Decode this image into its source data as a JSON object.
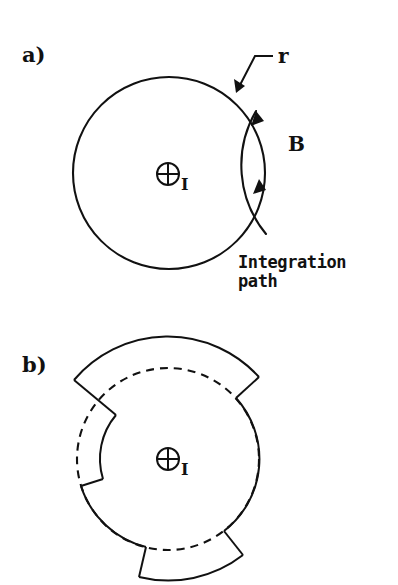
{
  "figure": {
    "domain": "Diagram",
    "background_color": "#ffffff",
    "ink_color": "#111111",
    "width": 398,
    "height": 585,
    "caption_present": false
  },
  "panels": [
    {
      "id": "a",
      "label": "a)",
      "label_position": {
        "x": 22,
        "y": 62
      },
      "description": "Current-carrying conductor cross-section with circular Amperian integration path",
      "conductor": {
        "shape": "circle",
        "center": {
          "x": 169,
          "y": 173
        },
        "radius": 96,
        "stroke": "solid"
      },
      "current_symbol": {
        "glyph": "circle-plus",
        "meaning": "current out of page",
        "center": {
          "x": 168,
          "y": 174
        },
        "radius": 11
      },
      "current_label": "I",
      "radius_label": "r",
      "radius_label_position": {
        "x": 278,
        "y": 63
      },
      "field_label": "B",
      "field_label_position": {
        "x": 288,
        "y": 144
      },
      "path_label_line1": "Integration",
      "path_label_line2": "path",
      "path_label_position": {
        "x": 238,
        "y": 262
      },
      "field_arc": {
        "center": {
          "x": 169,
          "y": 173
        },
        "radius": 108,
        "start_angle_deg": 52,
        "end_angle_deg": -36,
        "direction": "counterclockwise",
        "arrowhead_count": 2
      }
    },
    {
      "id": "b",
      "label": "b)",
      "label_position": {
        "x": 22,
        "y": 372
      },
      "description": "Same conductor with the integration path deformed into three stepped circular arc segments at differing radii; dashed curve marks the original circular path",
      "reference_circle": {
        "shape": "circle",
        "center": {
          "x": 168,
          "y": 459
        },
        "radius": 91,
        "stroke": "dashed"
      },
      "current_symbol": {
        "glyph": "circle-plus",
        "meaning": "current out of page",
        "center": {
          "x": 168,
          "y": 459
        },
        "radius": 11
      },
      "current_label": "I",
      "segments": [
        {
          "name": "outer-top-arc",
          "radius": 123,
          "start_angle_deg": 140,
          "end_angle_deg": 42,
          "stroke": "solid"
        },
        {
          "name": "mid-right-arc",
          "radius": 91,
          "start_angle_deg": 42,
          "end_angle_deg": -52,
          "stroke": "solid"
        },
        {
          "name": "outer-lower-right-arc",
          "radius": 122,
          "start_angle_deg": -52,
          "end_angle_deg": -104,
          "stroke": "solid"
        },
        {
          "name": "mid-bottom-arc",
          "radius": 91,
          "start_angle_deg": -104,
          "end_angle_deg": -163,
          "stroke": "solid"
        },
        {
          "name": "inner-left-arc",
          "radius": 68,
          "start_angle_deg": -163,
          "end_angle_deg": 140,
          "stroke": "solid"
        }
      ],
      "step_count": 4
    }
  ]
}
